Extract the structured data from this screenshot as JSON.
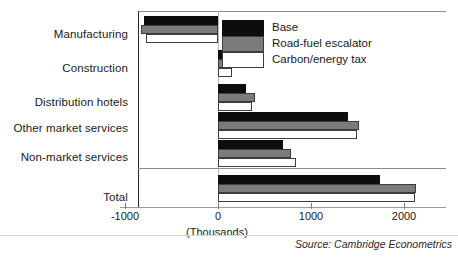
{
  "chart_data": {
    "type": "bar",
    "orientation": "horizontal",
    "title": "",
    "xlabel": "(Thousands)",
    "ylabel": "",
    "xlim": [
      -1000,
      2200
    ],
    "xticks": [
      -1000,
      0,
      1000,
      2000
    ],
    "xticklabels": [
      "-1000",
      "0",
      "1000",
      "2000"
    ],
    "grid": false,
    "legend_position": "upper-right-inside",
    "categories": [
      "Manufacturing",
      "Construction",
      "Distribution hotels",
      "Other market services",
      "Non-market services",
      "Total"
    ],
    "series": [
      {
        "name": "Base",
        "color": "#0d0d0d",
        "values": [
          -795,
          120,
          300,
          1400,
          700,
          1740
        ]
      },
      {
        "name": "Road-fuel escalator",
        "color": "#7b7b7b",
        "values": [
          -830,
          175,
          400,
          1520,
          780,
          2130
        ]
      },
      {
        "name": "Carbon/energy tax",
        "color": "#ffffff",
        "values": [
          -775,
          150,
          365,
          1490,
          835,
          2120
        ]
      }
    ],
    "annotations": {
      "source": "Source: Cambridge Econometrics",
      "separator_after_category": "Non-market services"
    }
  },
  "axis": {
    "units_label": "(Thousands)"
  },
  "legend": {
    "items": [
      {
        "label": "Base",
        "color": "#0d0d0d"
      },
      {
        "label": "Road-fuel escalator",
        "color": "#7b7b7b"
      },
      {
        "label": "Carbon/energy tax",
        "color": "#ffffff"
      }
    ]
  },
  "footer": {
    "source": "Source: Cambridge Econometrics"
  }
}
